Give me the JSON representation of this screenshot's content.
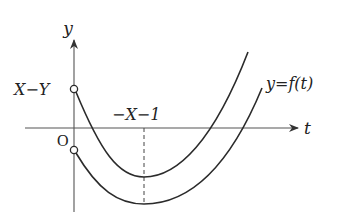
{
  "diagram": {
    "type": "function-graph",
    "axes": {
      "x_label": "t",
      "y_label": "y",
      "origin_label": "O"
    },
    "labels": {
      "y_intercept": "X−Y",
      "vertex_x": "−X−1",
      "curve": "y=f(t)"
    },
    "curves": [
      {
        "name": "upper-parabola",
        "description": "parabola starting at open point (0, X−Y), minimum at t=−X−1",
        "start_open_point": true
      },
      {
        "name": "lower-parabola",
        "description": "parabola y=f(t), starting at open point on negative y-axis, minimum at t=−X−1",
        "start_open_point": true
      }
    ],
    "colors": {
      "stroke": "#2b2b2b",
      "axis": "#555555",
      "background": "#ffffff"
    }
  }
}
